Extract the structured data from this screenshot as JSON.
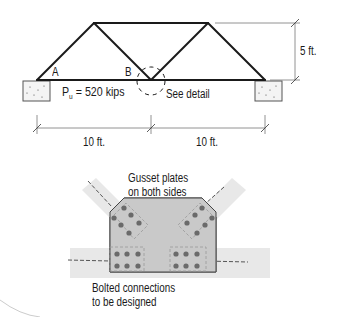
{
  "truss": {
    "node_a_label": "A",
    "node_b_label": "B",
    "load_symbol": "P",
    "load_subscript": "u",
    "load_value": " = 520 kips",
    "detail_label": "See detail",
    "height_dim": "5 ft.",
    "span_left_dim": "10 ft.",
    "span_right_dim": "10 ft."
  },
  "detail": {
    "gusset_label_line1": "Gusset plates",
    "gusset_label_line2": "on both sides",
    "bolted_label_line1": "Bolted connections",
    "bolted_label_line2": "to be designed"
  },
  "colors": {
    "line": "#1a1a1a",
    "gusset_fill": "#c8c8c8",
    "member_band": "#e6e6e6",
    "bolt": "#6a6a6a",
    "support_fill": "#f2f2f2"
  }
}
